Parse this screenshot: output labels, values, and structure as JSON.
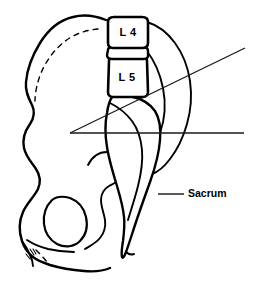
{
  "figure": {
    "background_color": "#ffffff",
    "line_color": "#000000",
    "width": 261,
    "height": 285
  },
  "labels": {
    "vertebra_l4": "L 4",
    "vertebra_l5": "L 5",
    "sacrum": "Sacrum"
  },
  "structures": [
    {
      "name": "ilium",
      "label": ""
    },
    {
      "name": "obturator-foramen",
      "label": ""
    },
    {
      "name": "ischium",
      "label": ""
    },
    {
      "name": "pubis",
      "label": ""
    },
    {
      "name": "sacrum-bone",
      "label": "Sacrum"
    },
    {
      "name": "coccyx",
      "label": ""
    },
    {
      "name": "vertebra-l4-body",
      "label": "L 4"
    },
    {
      "name": "vertebra-l5-body",
      "label": "L 5"
    },
    {
      "name": "intervertebral-disc",
      "label": ""
    }
  ],
  "measurement": {
    "name": "lumbosacral-angle",
    "horizontal_reference_line": "horizontal baseline",
    "inclined_line": "sacral inclination line",
    "vertex_x": 70,
    "vertex_y": 133
  }
}
